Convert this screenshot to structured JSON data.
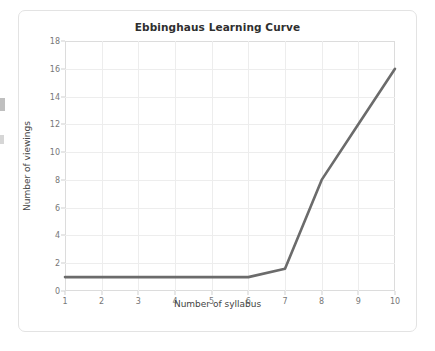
{
  "chart_data": {
    "type": "line",
    "title": "Ebbinghaus Learning Curve",
    "xlabel": "Number of syllabus",
    "ylabel": "Number of viewings",
    "x": [
      1,
      2,
      3,
      4,
      5,
      6,
      7,
      8,
      9,
      10
    ],
    "values": [
      1,
      1,
      1,
      1,
      1,
      1,
      1.6,
      8,
      12,
      16
    ],
    "series": [
      {
        "name": "Ebbinghaus Learning Curve",
        "values": [
          1,
          1,
          1,
          1,
          1,
          1,
          1.6,
          8,
          12,
          16
        ]
      }
    ],
    "xlim": [
      1,
      10
    ],
    "ylim": [
      0,
      18
    ],
    "xticks": [
      "1",
      "2",
      "3",
      "4",
      "5",
      "6",
      "7",
      "8",
      "9",
      "10"
    ],
    "yticks": [
      "0",
      "2",
      "4",
      "6",
      "8",
      "10",
      "12",
      "14",
      "16",
      "18"
    ],
    "grid": true,
    "legend": false,
    "legend_position": "none",
    "line_color": "#6b6b6b",
    "grid_color": "#ededed",
    "axis_color": "#dcdcdc",
    "background_color": "#ffffff",
    "title_color": "#2f2f2f",
    "tick_label_color": "#777777"
  }
}
